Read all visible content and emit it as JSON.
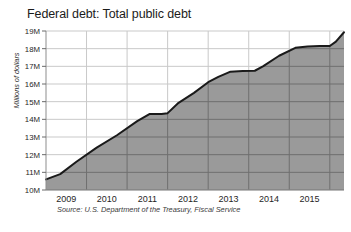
{
  "chart_data": {
    "type": "area",
    "title": "Federal debt: Total public debt",
    "xlabel": "",
    "ylabel": "Millions of dollars",
    "source": "Source: U.S. Department of the Treasury, Fiscal Service",
    "grid": true,
    "legend": "none",
    "xlim": [
      2008.75,
      2016.1
    ],
    "ylim": [
      10,
      19
    ],
    "y_ticks": [
      10,
      11,
      12,
      13,
      14,
      15,
      16,
      17,
      18,
      19
    ],
    "y_tick_labels": [
      "10M",
      "11M",
      "12M",
      "13M",
      "14M",
      "15M",
      "16M",
      "17M",
      "18M",
      "19M"
    ],
    "x_tick_labels": [
      "2009",
      "2010",
      "2011",
      "2012",
      "2013",
      "2014",
      "2015"
    ],
    "x_tick_centers": [
      2009.25,
      2010.25,
      2011.25,
      2012.25,
      2013.25,
      2014.25,
      2015.25
    ],
    "x_gridlines": [
      2009.75,
      2010.75,
      2011.75,
      2012.75,
      2013.75,
      2014.75,
      2015.75
    ],
    "series": [
      {
        "name": "Total public debt",
        "x": [
          2008.75,
          2009.1,
          2009.5,
          2010.0,
          2010.5,
          2011.0,
          2011.3,
          2011.6,
          2011.75,
          2012.0,
          2012.4,
          2012.75,
          2013.0,
          2013.3,
          2013.6,
          2013.9,
          2014.1,
          2014.5,
          2014.9,
          2015.2,
          2015.5,
          2015.75,
          2015.9,
          2016.1
        ],
        "values": [
          10.6,
          10.9,
          11.6,
          12.4,
          13.1,
          13.9,
          14.3,
          14.3,
          14.35,
          14.9,
          15.5,
          16.1,
          16.4,
          16.7,
          16.73,
          16.75,
          17.0,
          17.6,
          18.05,
          18.12,
          18.15,
          18.15,
          18.4,
          18.93
        ]
      }
    ],
    "colors": {
      "area_fill": "#9a9a9a",
      "line": "#1a1a1a",
      "grid": "#c9c9c9",
      "grid_over_fill": "#6f6f6f",
      "axis": "#8d8d8d",
      "text": "#1f1f1f",
      "background": "#ffffff"
    }
  }
}
